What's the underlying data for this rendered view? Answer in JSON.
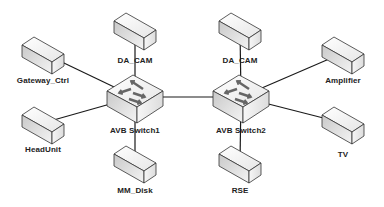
{
  "diagram": {
    "type": "network-topology",
    "switches": [
      {
        "id": "sw1",
        "label": "AVB Switch1",
        "x": 135,
        "y": 97
      },
      {
        "id": "sw2",
        "label": "AVB Switch2",
        "x": 241,
        "y": 97
      }
    ],
    "devices": [
      {
        "id": "dacam1",
        "label": "DA_CAM",
        "x": 135,
        "y": 29,
        "label_y": 56,
        "switch": "sw1"
      },
      {
        "id": "gateway",
        "label": "Gateway_Ctrl",
        "x": 43,
        "y": 53,
        "label_y": 76,
        "switch": "sw1"
      },
      {
        "id": "headunit",
        "label": "HeadUnit",
        "x": 43,
        "y": 123,
        "label_y": 145,
        "switch": "sw1"
      },
      {
        "id": "mmdisk",
        "label": "MM_Disk",
        "x": 135,
        "y": 162,
        "label_y": 186,
        "switch": "sw1"
      },
      {
        "id": "dacam2",
        "label": "DA_CAM",
        "x": 240,
        "y": 29,
        "label_y": 56,
        "switch": "sw2"
      },
      {
        "id": "amplifier",
        "label": "Amplifier",
        "x": 343,
        "y": 53,
        "label_y": 76,
        "switch": "sw2"
      },
      {
        "id": "tv",
        "label": "TV",
        "x": 343,
        "y": 123,
        "label_y": 150,
        "switch": "sw2"
      },
      {
        "id": "rse",
        "label": "RSE",
        "x": 240,
        "y": 162,
        "label_y": 186,
        "switch": "sw2"
      }
    ],
    "links": [
      [
        "sw1",
        "sw2"
      ],
      [
        "sw1",
        "dacam1"
      ],
      [
        "sw1",
        "gateway"
      ],
      [
        "sw1",
        "headunit"
      ],
      [
        "sw1",
        "mmdisk"
      ],
      [
        "sw2",
        "dacam2"
      ],
      [
        "sw2",
        "amplifier"
      ],
      [
        "sw2",
        "tv"
      ],
      [
        "sw2",
        "rse"
      ]
    ],
    "colors": {
      "line": "#1a1a1a",
      "box_top": "#f2f2f2",
      "box_front": "#d6d6d6",
      "box_side": "#ececec",
      "stroke": "#333333"
    }
  }
}
